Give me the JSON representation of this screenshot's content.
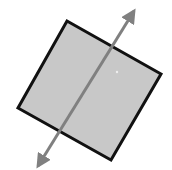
{
  "figure": {
    "colors": {
      "background": "#ffffff",
      "square_fill": "#c8c8c8",
      "square_stroke": "#111111",
      "axis": "#808080"
    },
    "square": {
      "corners": [
        [
          67,
          21
        ],
        [
          161,
          74
        ],
        [
          111,
          160
        ],
        [
          18,
          108
        ]
      ]
    },
    "axis": {
      "start": [
        38,
        168
      ],
      "end": [
        135,
        9
      ],
      "arrowheads": "both"
    }
  }
}
